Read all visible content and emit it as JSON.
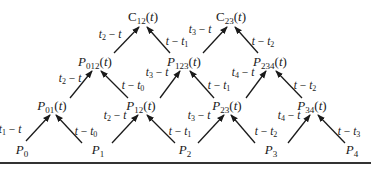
{
  "diagram": {
    "type": "pyramid-recursion",
    "nodes": [
      {
        "id": "P0",
        "base": "P",
        "sub": "0",
        "arg": "",
        "x": 22,
        "y": 150
      },
      {
        "id": "P1",
        "base": "P",
        "sub": "1",
        "arg": "",
        "x": 98,
        "y": 150
      },
      {
        "id": "P2",
        "base": "P",
        "sub": "2",
        "arg": "",
        "x": 185,
        "y": 150
      },
      {
        "id": "P3",
        "base": "P",
        "sub": "3",
        "arg": "",
        "x": 271,
        "y": 150
      },
      {
        "id": "P4",
        "base": "P",
        "sub": "4",
        "arg": "",
        "x": 352,
        "y": 150
      },
      {
        "id": "P01",
        "base": "P",
        "sub": "01",
        "arg": "(t)",
        "x": 52,
        "y": 106
      },
      {
        "id": "P12",
        "base": "P",
        "sub": "12",
        "arg": "(t)",
        "x": 141,
        "y": 106
      },
      {
        "id": "P23",
        "base": "P",
        "sub": "23",
        "arg": "(t)",
        "x": 227,
        "y": 106
      },
      {
        "id": "P34",
        "base": "P",
        "sub": "34",
        "arg": "(t)",
        "x": 312,
        "y": 106
      },
      {
        "id": "P012",
        "base": "P",
        "sub": "012",
        "arg": "(t)",
        "x": 95,
        "y": 62
      },
      {
        "id": "P123",
        "base": "P",
        "sub": "123",
        "arg": "(t)",
        "x": 184,
        "y": 62
      },
      {
        "id": "P234",
        "base": "P",
        "sub": "234",
        "arg": "(t)",
        "x": 270,
        "y": 62
      },
      {
        "id": "C12",
        "base": "C",
        "sub": "12",
        "arg": "(t)",
        "x": 143,
        "y": 17
      },
      {
        "id": "C23",
        "base": "C",
        "sub": "23",
        "arg": "(t)",
        "x": 231,
        "y": 17
      }
    ],
    "edges": [
      {
        "from": "P0",
        "to": "P01",
        "label": "t1 - t",
        "x1": 26,
        "y1": 141,
        "x2": 50,
        "y2": 115,
        "lx": 10,
        "ly": 130
      },
      {
        "from": "P1",
        "to": "P01",
        "label": "t - t0",
        "x1": 82,
        "y1": 143,
        "x2": 56,
        "y2": 115,
        "lx": 86,
        "ly": 132
      },
      {
        "from": "P1",
        "to": "P12",
        "label": "t2 - t",
        "x1": 112,
        "y1": 143,
        "x2": 138,
        "y2": 115,
        "lx": 115,
        "ly": 116
      },
      {
        "from": "P2",
        "to": "P12",
        "label": "t - t1",
        "x1": 175,
        "y1": 143,
        "x2": 147,
        "y2": 115,
        "lx": 180,
        "ly": 132
      },
      {
        "from": "P2",
        "to": "P23",
        "label": "t3 - t",
        "x1": 198,
        "y1": 143,
        "x2": 224,
        "y2": 115,
        "lx": 199,
        "ly": 116
      },
      {
        "from": "P3",
        "to": "P23",
        "label": "t - t2",
        "x1": 255,
        "y1": 143,
        "x2": 231,
        "y2": 115,
        "lx": 266,
        "ly": 132
      },
      {
        "from": "P3",
        "to": "P34",
        "label": "t4 - t",
        "x1": 288,
        "y1": 143,
        "x2": 310,
        "y2": 115,
        "lx": 289,
        "ly": 116
      },
      {
        "from": "P4",
        "to": "P34",
        "label": "t - t3",
        "x1": 345,
        "y1": 143,
        "x2": 318,
        "y2": 115,
        "lx": 349,
        "ly": 132
      },
      {
        "from": "P01",
        "to": "P012",
        "label": "t2 - t",
        "x1": 70,
        "y1": 98,
        "x2": 92,
        "y2": 71,
        "lx": 70,
        "ly": 79
      },
      {
        "from": "P12",
        "to": "P012",
        "label": "t - t0",
        "x1": 128,
        "y1": 98,
        "x2": 101,
        "y2": 71,
        "lx": 133,
        "ly": 86
      },
      {
        "from": "P12",
        "to": "P123",
        "label": "t3 - t",
        "x1": 160,
        "y1": 98,
        "x2": 180,
        "y2": 71,
        "lx": 157,
        "ly": 73
      },
      {
        "from": "P23",
        "to": "P123",
        "label": "t - t1",
        "x1": 214,
        "y1": 98,
        "x2": 190,
        "y2": 71,
        "lx": 219,
        "ly": 86
      },
      {
        "from": "P23",
        "to": "P234",
        "label": "t4 - t",
        "x1": 246,
        "y1": 98,
        "x2": 266,
        "y2": 71,
        "lx": 243,
        "ly": 73
      },
      {
        "from": "P34",
        "to": "P234",
        "label": "t - t2",
        "x1": 302,
        "y1": 98,
        "x2": 276,
        "y2": 71,
        "lx": 305,
        "ly": 86
      },
      {
        "from": "P012",
        "to": "C12",
        "label": "t2 - t",
        "x1": 114,
        "y1": 53,
        "x2": 139,
        "y2": 27,
        "lx": 110,
        "ly": 35
      },
      {
        "from": "P123",
        "to": "C12",
        "label": "t - t1",
        "x1": 170,
        "y1": 53,
        "x2": 147,
        "y2": 27,
        "lx": 177,
        "ly": 42
      },
      {
        "from": "P123",
        "to": "C23",
        "label": "t3 - t",
        "x1": 203,
        "y1": 53,
        "x2": 227,
        "y2": 27,
        "lx": 200,
        "ly": 30
      },
      {
        "from": "P234",
        "to": "C23",
        "label": "t - t2",
        "x1": 258,
        "y1": 53,
        "x2": 235,
        "y2": 27,
        "lx": 263,
        "ly": 42
      }
    ],
    "labels_display": [
      {
        "pre": "t",
        "sub": "1",
        "mid": " − ",
        "post": "t"
      },
      {
        "pre": "t",
        "sub": "",
        "mid": " − ",
        "post": "t",
        "post_sub": "0"
      }
    ],
    "rule_y": 162
  }
}
